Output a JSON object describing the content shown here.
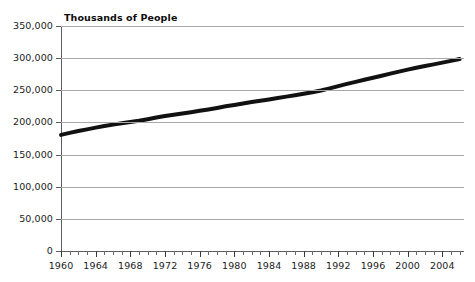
{
  "chart_data": {
    "type": "line",
    "title": "Thousands of People",
    "xlabel": "",
    "ylabel": "",
    "xlim": [
      1960,
      2006.5
    ],
    "ylim": [
      0,
      350000
    ],
    "grid": true,
    "legend": "none",
    "x_tick_labels": [
      "1960",
      "1964",
      "1968",
      "1972",
      "1976",
      "1980",
      "1984",
      "1988",
      "1992",
      "1996",
      "2000",
      "2004"
    ],
    "x_ticks": [
      1960,
      1964,
      1968,
      1972,
      1976,
      1980,
      1984,
      1988,
      1992,
      1996,
      2000,
      2004
    ],
    "x_minor_tick_interval": 1,
    "y_tick_labels": [
      "0",
      "50,000",
      "100,000",
      "150,000",
      "200,000",
      "250,000",
      "300,000",
      "350,000"
    ],
    "y_ticks": [
      0,
      50000,
      100000,
      150000,
      200000,
      250000,
      300000,
      350000
    ],
    "series": [
      {
        "name": "Population",
        "color": "#111111",
        "line_width": 4,
        "x": [
          1960,
          1961,
          1962,
          1963,
          1964,
          1965,
          1966,
          1967,
          1968,
          1969,
          1970,
          1971,
          1972,
          1973,
          1974,
          1975,
          1976,
          1977,
          1978,
          1979,
          1980,
          1981,
          1982,
          1983,
          1984,
          1985,
          1986,
          1987,
          1988,
          1989,
          1990,
          1991,
          1992,
          1993,
          1994,
          1995,
          1996,
          1997,
          1998,
          1999,
          2000,
          2001,
          2002,
          2003,
          2004,
          2005,
          2006
        ],
        "values": [
          180671,
          183691,
          186538,
          189242,
          191889,
          194303,
          196560,
          198712,
          200706,
          202677,
          205052,
          207661,
          209896,
          211909,
          213854,
          215973,
          218035,
          220239,
          222585,
          225055,
          227225,
          229466,
          231664,
          233792,
          235825,
          237924,
          240133,
          242289,
          244499,
          246819,
          249623,
          252981,
          256514,
          259919,
          263126,
          266278,
          269394,
          272647,
          275854,
          279040,
          282172,
          285082,
          287804,
          290326,
          293046,
          295753,
          298593
        ]
      }
    ]
  },
  "figure": {
    "background_color": "#ffffff",
    "gridline_color": "#a8a8a8",
    "axis_color": "#5d5d5d",
    "text_color": "#1b1b1b"
  }
}
